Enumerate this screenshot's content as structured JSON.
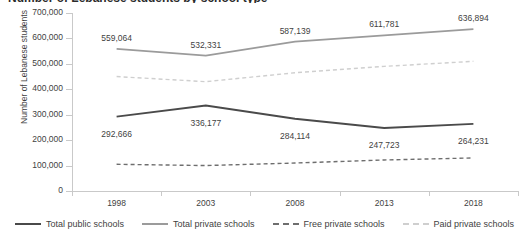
{
  "chart_data": {
    "type": "line",
    "title": "Number of Lebanese students by school type",
    "xlabel": "",
    "ylabel": "Number of Lebanese students",
    "categories": [
      "1998",
      "2003",
      "2008",
      "2013",
      "2018"
    ],
    "ylim": [
      0,
      700000
    ],
    "ytick_labels": [
      "700,000",
      "600,000",
      "500,000",
      "400,000",
      "300,000",
      "200,000",
      "100,000",
      "0"
    ],
    "ytick_values": [
      700000,
      600000,
      500000,
      400000,
      300000,
      200000,
      100000,
      0
    ],
    "grid": false,
    "legend_position": "bottom",
    "series": [
      {
        "name": "Total public schools",
        "style": "solid",
        "color": "#4a4a4a",
        "values": [
          292666,
          336177,
          284114,
          247723,
          264231
        ],
        "labels": [
          "292,666",
          "336,177",
          "284,114",
          "247,723",
          "264,231"
        ],
        "labelled": true
      },
      {
        "name": "Total private schools",
        "style": "solid",
        "color": "#9b9b9b",
        "values": [
          559064,
          532331,
          587139,
          611781,
          636894
        ],
        "labels": [
          "559,064",
          "532,331",
          "587,139",
          "611,781",
          "636,894"
        ],
        "labelled": true
      },
      {
        "name": "Free private schools",
        "style": "dashed",
        "color": "#6e6e6e",
        "values": [
          105000,
          100000,
          110000,
          122000,
          130000
        ],
        "labels": [
          "",
          "",
          "",
          "",
          ""
        ],
        "labelled": false
      },
      {
        "name": "Paid private schools",
        "style": "dashed",
        "color": "#cfcfcf",
        "values": [
          450000,
          430000,
          465000,
          490000,
          510000
        ],
        "labels": [
          "",
          "",
          "",
          "",
          ""
        ],
        "labelled": false
      }
    ]
  },
  "legend": {
    "items": [
      {
        "label": "Total public schools"
      },
      {
        "label": "Total private schools"
      },
      {
        "label": "Free private schools"
      },
      {
        "label": "Paid private schools"
      }
    ]
  }
}
